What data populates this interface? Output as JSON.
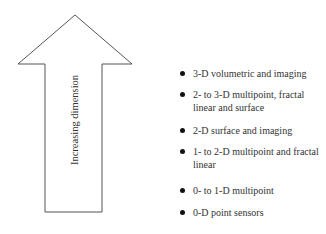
{
  "arrow": {
    "label": "Increasing dimension",
    "direction": "up",
    "stroke_color": "#555555"
  },
  "list": {
    "items": [
      {
        "label": "3-D volumetric and imaging"
      },
      {
        "label": "2- to 3-D multipoint, fractal linear and surface"
      },
      {
        "label": "2-D surface and imaging"
      },
      {
        "label": "1- to 2-D multipoint and fractal linear"
      },
      {
        "label": "0- to 1-D multipoint"
      },
      {
        "label": "0-D point sensors"
      }
    ]
  }
}
